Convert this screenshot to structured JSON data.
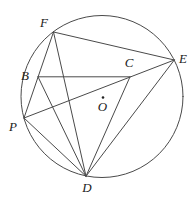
{
  "figure": {
    "width": 196,
    "height": 213,
    "background_color": "#ffffff",
    "stroke_color": "#4a4a4a",
    "label_color": "#222222",
    "circle": {
      "cx": 102,
      "cy": 96.5,
      "r": 81
    },
    "points": {
      "F": {
        "x": 53.5,
        "y": 32
      },
      "E": {
        "x": 174.3,
        "y": 60
      },
      "B": {
        "x": 38,
        "y": 76.8
      },
      "C": {
        "x": 130,
        "y": 76.8
      },
      "P": {
        "x": 24,
        "y": 118
      },
      "D": {
        "x": 86,
        "y": 176.2
      },
      "O": {
        "x": 103,
        "y": 97.5
      }
    },
    "segments": [
      {
        "from": "F",
        "to": "E"
      },
      {
        "from": "F",
        "to": "P"
      },
      {
        "from": "F",
        "to": "D"
      },
      {
        "from": "P",
        "to": "E"
      },
      {
        "from": "P",
        "to": "D"
      },
      {
        "from": "D",
        "to": "E"
      },
      {
        "from": "B",
        "to": "C"
      },
      {
        "from": "B",
        "to": "D"
      },
      {
        "from": "C",
        "to": "D"
      }
    ],
    "center_dot": {
      "point": "O",
      "r": 1.3
    },
    "labels": [
      {
        "text": "F",
        "x": 44,
        "y": 27
      },
      {
        "text": "E",
        "x": 183,
        "y": 62.5
      },
      {
        "text": "B",
        "x": 25,
        "y": 80
      },
      {
        "text": "C",
        "x": 129,
        "y": 66.5
      },
      {
        "text": "P",
        "x": 13,
        "y": 130.5
      },
      {
        "text": "D",
        "x": 87,
        "y": 192
      },
      {
        "text": "O",
        "x": 102.5,
        "y": 111
      }
    ]
  }
}
